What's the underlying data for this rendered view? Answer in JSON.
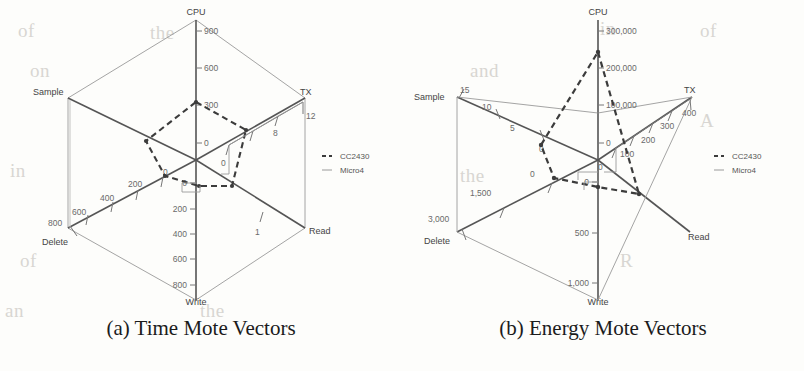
{
  "figure": {
    "background_color": "#fdfdfb",
    "ink_color": "#555555",
    "series_colors": {
      "CC2430": "#3c3c3c",
      "Micro4": "#9a9a9a"
    }
  },
  "bleed_text": [
    {
      "text": "of",
      "x": 18,
      "y": 20
    },
    {
      "text": "the",
      "x": 150,
      "y": 22
    },
    {
      "text": "in",
      "x": 600,
      "y": 18
    },
    {
      "text": "of",
      "x": 700,
      "y": 20
    },
    {
      "text": "on",
      "x": 30,
      "y": 60
    },
    {
      "text": "and",
      "x": 470,
      "y": 60
    },
    {
      "text": "A",
      "x": 700,
      "y": 110
    },
    {
      "text": "in",
      "x": 10,
      "y": 160
    },
    {
      "text": "the",
      "x": 460,
      "y": 165
    },
    {
      "text": "of",
      "x": 20,
      "y": 250
    },
    {
      "text": "R",
      "x": 620,
      "y": 250
    },
    {
      "text": "an",
      "x": 5,
      "y": 300
    },
    {
      "text": "the",
      "x": 200,
      "y": 300
    }
  ],
  "charts": [
    {
      "id": "time-mote-vectors",
      "caption": "(a) Time Mote Vectors",
      "legend": [
        {
          "label": "CC2430",
          "style": "dashed"
        },
        {
          "label": "Micro4",
          "style": "solid"
        }
      ]
    },
    {
      "id": "energy-mote-vectors",
      "caption": "(b) Energy Mote Vectors",
      "legend": [
        {
          "label": "CC2430",
          "style": "dashed"
        },
        {
          "label": "Micro4",
          "style": "solid"
        }
      ]
    }
  ],
  "chart_data": [
    {
      "type": "radar",
      "id": "time-mote-vectors",
      "title": "(a) Time Mote Vectors",
      "axes": [
        {
          "name": "CPU",
          "ticks": [
            0,
            300,
            600,
            900
          ],
          "tick_labels": [
            "0",
            "300",
            "600",
            "900"
          ],
          "max": 900
        },
        {
          "name": "TX",
          "ticks": [
            0,
            4,
            8,
            12
          ],
          "tick_labels": [
            "0",
            "",
            "8",
            "12"
          ],
          "max": 12
        },
        {
          "name": "Read",
          "ticks": [
            0,
            1
          ],
          "tick_labels": [
            "0",
            "1"
          ],
          "max": 1
        },
        {
          "name": "Write",
          "ticks": [
            0,
            200,
            400,
            600,
            800
          ],
          "tick_labels": [
            "0",
            "200",
            "400",
            "600",
            "800"
          ],
          "max": 800
        },
        {
          "name": "Delete",
          "ticks": [
            0,
            200,
            400,
            600,
            800
          ],
          "tick_labels": [
            "0",
            "200",
            "400",
            "600",
            "800"
          ],
          "max": 800
        },
        {
          "name": "Sample",
          "ticks": [
            0
          ],
          "tick_labels": [
            "0"
          ],
          "max": 1
        }
      ],
      "series": [
        {
          "name": "CC2430",
          "style": "dashed",
          "values": [
            330,
            8.0,
            0.3,
            30,
            120,
            0.38
          ]
        },
        {
          "name": "Micro4",
          "style": "solid",
          "values": [
            900,
            12,
            1,
            800,
            800,
            1
          ]
        }
      ],
      "legend_position": "right",
      "grid": false
    },
    {
      "type": "radar",
      "id": "energy-mote-vectors",
      "title": "(b) Energy Mote Vectors",
      "axes": [
        {
          "name": "CPU",
          "ticks": [
            0,
            100000,
            200000,
            300000
          ],
          "tick_labels": [
            "0",
            "100,000",
            "200,000",
            "300,000"
          ],
          "max": 300000
        },
        {
          "name": "TX",
          "ticks": [
            0,
            100,
            200,
            300,
            400
          ],
          "tick_labels": [
            "0",
            "100",
            "200",
            "300",
            "400"
          ],
          "max": 400
        },
        {
          "name": "Read",
          "ticks": [
            0
          ],
          "tick_labels": [
            "0"
          ],
          "max": 1
        },
        {
          "name": "Write",
          "ticks": [
            0,
            500,
            1000
          ],
          "tick_labels": [
            "0",
            "500",
            "1,000"
          ],
          "max": 1000
        },
        {
          "name": "Delete",
          "ticks": [
            0,
            1500,
            3000
          ],
          "tick_labels": [
            "0",
            "1,500",
            "3,000"
          ],
          "max": 3000
        },
        {
          "name": "Sample",
          "ticks": [
            0,
            5,
            10,
            15
          ],
          "tick_labels": [
            "0",
            "5",
            "10",
            "15"
          ],
          "max": 15
        }
      ],
      "series": [
        {
          "name": "CC2430",
          "style": "dashed",
          "values": [
            262000,
            130,
            0.62,
            40,
            260,
            4.5
          ]
        },
        {
          "name": "Micro4",
          "style": "solid",
          "values": [
            12000,
            400,
            1,
            1000,
            3000,
            15
          ]
        }
      ],
      "legend_position": "right",
      "grid": false
    }
  ]
}
